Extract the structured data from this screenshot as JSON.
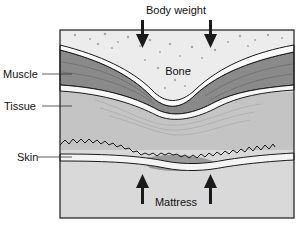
{
  "diagram": {
    "title_label": "Body weight",
    "layers": {
      "bone": "Bone",
      "muscle": "Muscle",
      "tissue": "Tissue",
      "skin": "Skin",
      "mattress": "Mattress"
    },
    "arrows": {
      "top": [
        "down",
        "down"
      ],
      "bottom": [
        "up",
        "up"
      ]
    },
    "colors": {
      "bone": "#ececec",
      "muscle": "#8a8a8a",
      "tissue": "#c4c4c4",
      "skin_compressed": "#9a9a9a",
      "mattress": "#d9d9d9",
      "outline": "#1a1a1a"
    }
  }
}
